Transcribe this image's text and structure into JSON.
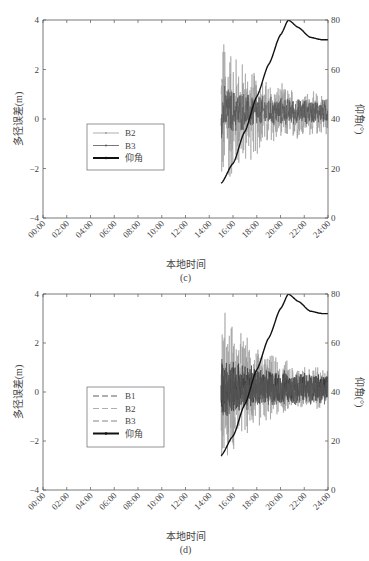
{
  "chart_data": [
    {
      "panel": "(c)",
      "type": "line",
      "xlabel": "本地时间",
      "ylabel": "多径误差(m)",
      "y2label": "仰角(°)",
      "xticks": [
        "00:00",
        "02:00",
        "04:00",
        "06:00",
        "08:00",
        "10:00",
        "12:00",
        "14:00",
        "16:00",
        "18:00",
        "20:00",
        "22:00",
        "24:00"
      ],
      "yticks": [
        "-4",
        "-2",
        "0",
        "2",
        "4"
      ],
      "y2ticks": [
        "0",
        "20",
        "40",
        "60",
        "80"
      ],
      "ylim": [
        -4,
        4
      ],
      "y2lim": [
        0,
        80
      ],
      "legend": [
        "B2",
        "B3",
        "仰角"
      ],
      "legend_position": "center-left",
      "series": [
        {
          "name": "B2",
          "axis": "left",
          "style": "thin light gray line with dots",
          "x_start": "15:00",
          "x_end": "24:00",
          "amplitude_start": 3.8,
          "amplitude_end": 0.8,
          "mean": 0.2
        },
        {
          "name": "B3",
          "axis": "left",
          "style": "thin dark gray line with dots",
          "x_start": "15:00",
          "x_end": "24:00",
          "amplitude_start": 1.2,
          "amplitude_end": 0.5,
          "mean": 0.3
        },
        {
          "name": "仰角",
          "axis": "right",
          "style": "thick black line",
          "x": [
            "15:00",
            "16:00",
            "17:00",
            "18:00",
            "19:00",
            "20:00",
            "20:40",
            "21:30",
            "22:30",
            "23:30",
            "24:00"
          ],
          "values": [
            14,
            22,
            35,
            49,
            62,
            74,
            80,
            77,
            73,
            72,
            72
          ]
        }
      ]
    },
    {
      "panel": "(d)",
      "type": "line",
      "xlabel": "本地时间",
      "ylabel": "多径误差(m)",
      "y2label": "仰角(°)",
      "xticks": [
        "00:00",
        "02:00",
        "04:00",
        "06:00",
        "08:00",
        "10:00",
        "12:00",
        "14:00",
        "16:00",
        "18:00",
        "20:00",
        "22:00",
        "24:00"
      ],
      "yticks": [
        "-4",
        "-2",
        "0",
        "2",
        "4"
      ],
      "y2ticks": [
        "0",
        "20",
        "40",
        "60",
        "80"
      ],
      "ylim": [
        -4,
        4
      ],
      "y2lim": [
        0,
        80
      ],
      "legend": [
        "B1",
        "B2",
        "B3",
        "仰角"
      ],
      "legend_position": "center-left",
      "series": [
        {
          "name": "B1",
          "axis": "left",
          "style": "dashed dark line",
          "x_start": "15:00",
          "x_end": "24:00",
          "amplitude_start": 1.5,
          "amplitude_end": 0.6,
          "mean": 0.2
        },
        {
          "name": "B2",
          "axis": "left",
          "style": "dashed light gray line",
          "x_start": "15:00",
          "x_end": "24:00",
          "amplitude_start": 3.8,
          "amplitude_end": 0.8,
          "mean": 0.2
        },
        {
          "name": "B3",
          "axis": "left",
          "style": "dashed gray line",
          "x_start": "15:00",
          "x_end": "24:00",
          "amplitude_start": 1.3,
          "amplitude_end": 0.6,
          "mean": 0.1
        },
        {
          "name": "仰角",
          "axis": "right",
          "style": "thick black line",
          "x": [
            "15:00",
            "16:00",
            "17:00",
            "18:00",
            "19:00",
            "20:00",
            "20:40",
            "21:30",
            "22:30",
            "23:30",
            "24:00"
          ],
          "values": [
            14,
            22,
            35,
            49,
            62,
            74,
            80,
            77,
            73,
            72,
            72
          ]
        }
      ]
    }
  ],
  "panels": [
    {
      "caption": "(c)",
      "xlabel": "本地时间",
      "ylabel": "多径误差(m)",
      "y2label": "仰角(°)",
      "legend": [
        {
          "label": "B2",
          "color": "#9a9a9a",
          "dash": "",
          "marker": true
        },
        {
          "label": "B3",
          "color": "#555555",
          "dash": "",
          "marker": true
        },
        {
          "label": "仰角",
          "color": "#111111",
          "dash": "",
          "marker": true,
          "thick": true
        }
      ]
    },
    {
      "caption": "(d)",
      "xlabel": "本地时间",
      "ylabel": "多径误差(m)",
      "y2label": "仰角(°)",
      "legend": [
        {
          "label": "B1",
          "color": "#333333",
          "dash": "6,3",
          "marker": false
        },
        {
          "label": "B2",
          "color": "#9a9a9a",
          "dash": "6,3",
          "marker": false
        },
        {
          "label": "B3",
          "color": "#666666",
          "dash": "6,3",
          "marker": false
        },
        {
          "label": "仰角",
          "color": "#111111",
          "dash": "",
          "marker": true,
          "thick": true
        }
      ]
    }
  ],
  "colors": {
    "axis": "#555555",
    "elevation": "#111111",
    "b1": "#333333",
    "b2": "#9a9a9a",
    "b3": "#555555"
  }
}
